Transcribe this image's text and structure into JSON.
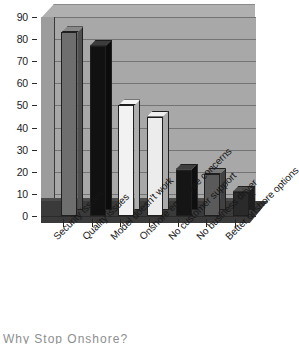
{
  "chart_data": {
    "type": "bar",
    "title": "",
    "subtitle": "",
    "xlabel": "",
    "ylabel": "",
    "ylim": [
      0,
      90
    ],
    "ytick_step": 10,
    "yticks": [
      "90",
      "80",
      "70",
      "60",
      "50",
      "40",
      "30",
      "20",
      "10",
      "0"
    ],
    "grid": true,
    "legend": false,
    "legend_position": "none",
    "style": "3d-bar-grayscale",
    "categories": [
      "Security issues",
      "Quality issues",
      "Model doesn't work",
      "Onshore employee concerns",
      "No customer support",
      "No business driver",
      "Better onshore options"
    ],
    "values": [
      83,
      77,
      50,
      45,
      21,
      19,
      11
    ],
    "bar_colors": [
      "#6e6e6e",
      "#111111",
      "#f2f2f2",
      "#ececec",
      "#151515",
      "#5a5a5a",
      "#2a2a2a"
    ],
    "annotations": []
  },
  "figure": {
    "plot_background": "#a8a8a8",
    "floor_color": "#3a3a3a",
    "gridline_color": "#747474",
    "axis_color": "#2a2a2a",
    "page_background": "#ffffff",
    "label_rotation": "-45"
  },
  "caption": {
    "cutoff_text": "Why Stop Onshore?"
  }
}
